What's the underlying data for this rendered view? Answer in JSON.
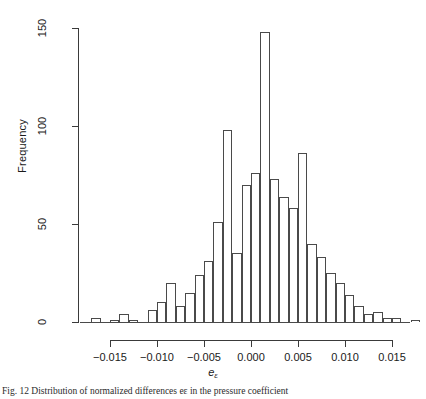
{
  "figure": {
    "caption": "Fig. 12 Distribution of normalized differences eε in the pressure coefficient"
  },
  "chart_data": {
    "type": "bar",
    "subtype": "histogram",
    "title": "",
    "xlabel": "e",
    "xlabel_sub": "ε",
    "ylabel": "Frequency",
    "xlim": [
      -0.0185,
      0.0185
    ],
    "ylim": [
      0,
      152
    ],
    "grid": false,
    "legend": null,
    "bin_width": 0.001,
    "x_ticks": [
      -0.015,
      -0.01,
      -0.005,
      0.0,
      0.005,
      0.01,
      0.015
    ],
    "x_tick_labels": [
      "-0.015",
      "-0.010",
      "-0.005",
      "0.000",
      "0.005",
      "0.010",
      "0.015"
    ],
    "y_ticks": [
      0,
      50,
      100,
      150
    ],
    "y_tick_labels": [
      "0",
      "50",
      "100",
      "150"
    ],
    "bin_starts": [
      -0.017,
      -0.016,
      -0.015,
      -0.014,
      -0.013,
      -0.012,
      -0.011,
      -0.01,
      -0.009,
      -0.008,
      -0.007,
      -0.006,
      -0.005,
      -0.004,
      -0.003,
      -0.002,
      -0.001,
      0.0,
      0.001,
      0.002,
      0.003,
      0.004,
      0.005,
      0.006,
      0.007,
      0.008,
      0.009,
      0.01,
      0.011,
      0.012,
      0.013,
      0.014,
      0.015,
      0.016,
      0.017
    ],
    "values": [
      2,
      0,
      1,
      4,
      1,
      0,
      6,
      10,
      20,
      8,
      15,
      24,
      31,
      51,
      98,
      35,
      70,
      76,
      148,
      73,
      64,
      58,
      86,
      40,
      33,
      25,
      20,
      14,
      8,
      4,
      5,
      2,
      2,
      0,
      1
    ]
  }
}
